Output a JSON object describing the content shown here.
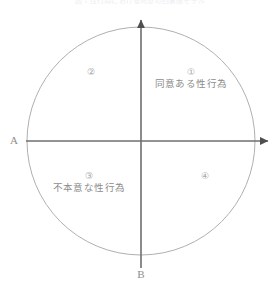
{
  "caption": {
    "text": "図 1 性行為における同意の四象限モデル"
  },
  "diagram": {
    "shape": "circle",
    "axes": {
      "horizontal_label": "A",
      "vertical_label": "B",
      "horizontal_arrow": "right-arrowhead",
      "vertical_arrow": "up-arrowhead"
    },
    "quadrants": [
      {
        "number": "①",
        "label": "同意ある性行為",
        "position": "top-right"
      },
      {
        "number": "②",
        "label": "",
        "position": "top-left"
      },
      {
        "number": "③",
        "label": "不本意な性行為",
        "position": "bottom-left"
      },
      {
        "number": "④",
        "label": "",
        "position": "bottom-right"
      }
    ],
    "colors": {
      "circle_stroke": "#b0b0b0",
      "axis_stroke": "#6f6f6f",
      "text": "#8c8c8c",
      "background": "#ffffff"
    }
  }
}
